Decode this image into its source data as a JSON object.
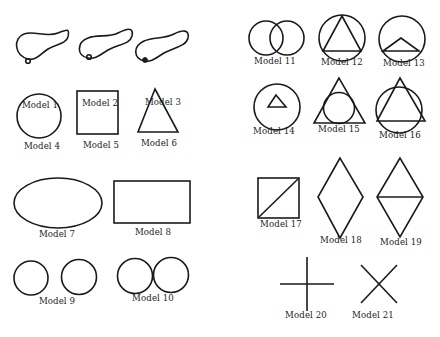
{
  "models": [
    {
      "id": 1,
      "label": "Model 1",
      "shape": "closed-loop-with-dot",
      "x": 40,
      "y": 107
    },
    {
      "id": 2,
      "label": "Model 2",
      "shape": "closed-loop-with-dot",
      "x": 100,
      "y": 105
    },
    {
      "id": 3,
      "label": "Model 3",
      "shape": "closed-loop-with-dot",
      "x": 163,
      "y": 104
    },
    {
      "id": 4,
      "label": "Model 4",
      "shape": "circle",
      "x": 42,
      "y": 148
    },
    {
      "id": 5,
      "label": "Model 5",
      "shape": "square",
      "x": 101,
      "y": 147
    },
    {
      "id": 6,
      "label": "Model 6",
      "shape": "triangle",
      "x": 159,
      "y": 145
    },
    {
      "id": 7,
      "label": "Model 7",
      "shape": "ellipse",
      "x": 57,
      "y": 236
    },
    {
      "id": 8,
      "label": "Model 8",
      "shape": "rectangle",
      "x": 153,
      "y": 234
    },
    {
      "id": 9,
      "label": "Model 9",
      "shape": "two-separate-circles",
      "x": 57,
      "y": 303
    },
    {
      "id": 10,
      "label": "Model 10",
      "shape": "two-touching-circles",
      "x": 153,
      "y": 300
    },
    {
      "id": 11,
      "label": "Model 11",
      "shape": "two-overlapping-circles",
      "x": 275,
      "y": 63
    },
    {
      "id": 12,
      "label": "Model 12",
      "shape": "triangle-inscribed-in-circle",
      "x": 342,
      "y": 64
    },
    {
      "id": 13,
      "label": "Model 13",
      "shape": "circle-with-small-triangle-on-chord",
      "x": 404,
      "y": 65
    },
    {
      "id": 14,
      "label": "Model 14",
      "shape": "circle-with-small-inner-triangle",
      "x": 274,
      "y": 133
    },
    {
      "id": 15,
      "label": "Model 15",
      "shape": "circle-inscribed-in-triangle",
      "x": 339,
      "y": 131
    },
    {
      "id": 16,
      "label": "Model 16",
      "shape": "overlapping-triangle-and-circle",
      "x": 400,
      "y": 137
    },
    {
      "id": 17,
      "label": "Model 17",
      "shape": "square-with-diagonal",
      "x": 281,
      "y": 226
    },
    {
      "id": 18,
      "label": "Model 18",
      "shape": "rhombus",
      "x": 341,
      "y": 242
    },
    {
      "id": 19,
      "label": "Model 19",
      "shape": "rhombus-with-horizontal-diagonal",
      "x": 401,
      "y": 244
    },
    {
      "id": 20,
      "label": "Model 20",
      "shape": "plus-cross",
      "x": 306,
      "y": 317
    },
    {
      "id": 21,
      "label": "Model 21",
      "shape": "x-cross",
      "x": 373,
      "y": 317
    }
  ],
  "colors": {
    "stroke": "#1a1a1a",
    "background": "#ffffff",
    "text": "#222222"
  }
}
